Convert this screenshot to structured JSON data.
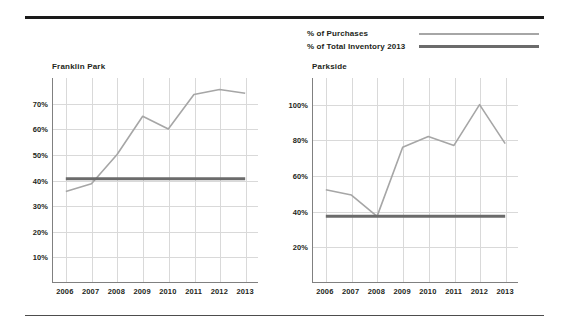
{
  "legend": {
    "items": [
      {
        "label": "% of Purchases",
        "color": "#a6a6a6",
        "thickness": "2px"
      },
      {
        "label": "% of Total Inventory 2013",
        "color": "#6b6b6b",
        "thickness": "3px"
      }
    ]
  },
  "charts": [
    {
      "title": "Franklin Park",
      "ylabels": [
        "70%",
        "60%",
        "50%",
        "40%",
        "30%",
        "20%",
        "10%"
      ],
      "xlabels": [
        "2006",
        "2007",
        "2008",
        "2009",
        "2010",
        "2011",
        "2012",
        "2013"
      ]
    },
    {
      "title": "Parkside",
      "ylabels": [
        "100%",
        "80%",
        "60%",
        "40%",
        "20%"
      ],
      "xlabels": [
        "2006",
        "2007",
        "2008",
        "2009",
        "2010",
        "2011",
        "2012",
        "2013"
      ]
    }
  ],
  "chart_data": [
    {
      "type": "line",
      "title": "Franklin Park",
      "xlabel": "",
      "ylabel": "",
      "x": [
        2006,
        2007,
        2008,
        2009,
        2010,
        2011,
        2012,
        2013
      ],
      "xlim": [
        2005.5,
        2013.5
      ],
      "ylim": [
        0,
        80
      ],
      "yticks": [
        10,
        20,
        30,
        40,
        50,
        60,
        70
      ],
      "grid": true,
      "legend_position": "top-right-shared",
      "series": [
        {
          "name": "% of Purchases",
          "color": "#a6a6a6",
          "values": [
            35.5,
            38.5,
            50.0,
            65.0,
            60.0,
            73.5,
            75.5,
            74.0
          ]
        },
        {
          "name": "% of Total Inventory 2013",
          "color": "#6b6b6b",
          "values": [
            40.5,
            40.5,
            40.5,
            40.5,
            40.5,
            40.5,
            40.5,
            40.5
          ]
        }
      ]
    },
    {
      "type": "line",
      "title": "Parkside",
      "xlabel": "",
      "ylabel": "",
      "x": [
        2006,
        2007,
        2008,
        2009,
        2010,
        2011,
        2012,
        2013
      ],
      "xlim": [
        2005.5,
        2013.5
      ],
      "ylim": [
        0,
        115
      ],
      "yticks": [
        20,
        40,
        60,
        80,
        100
      ],
      "grid": true,
      "legend_position": "top-right-shared",
      "series": [
        {
          "name": "% of Purchases",
          "color": "#a6a6a6",
          "values": [
            52.0,
            49.0,
            37.0,
            76.0,
            82.0,
            77.0,
            100.0,
            78.0
          ]
        },
        {
          "name": "% of Total Inventory 2013",
          "color": "#6b6b6b",
          "values": [
            37.0,
            37.0,
            37.0,
            37.0,
            37.0,
            37.0,
            37.0,
            37.0
          ]
        }
      ]
    }
  ]
}
